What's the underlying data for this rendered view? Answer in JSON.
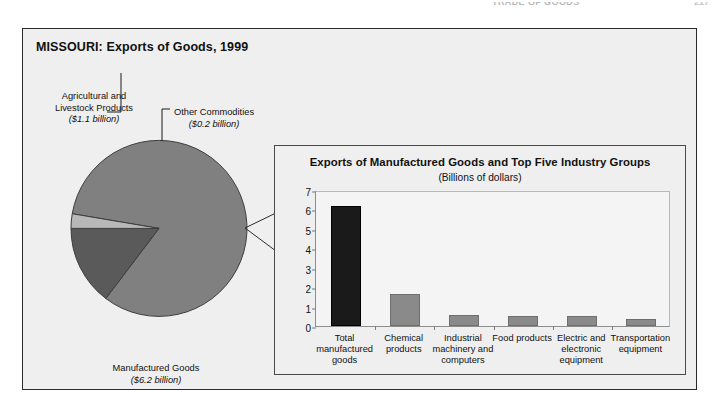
{
  "running_head": {
    "text": "TRADE OF GOODS",
    "page": "217"
  },
  "figure": {
    "title": "MISSOURI: Exports of Goods, 1999",
    "colors": {
      "frame_bg": "#efefef",
      "frame_border": "#2b2b2b",
      "pie_manufactured": "#808080",
      "pie_agricultural": "#5a5a5a",
      "pie_other": "#b8b8b8",
      "bar_total": "#1a1a1a",
      "bar_industry": "#8a8a8a"
    }
  },
  "pie_labels": {
    "agricultural_name": "Agricultural and Livestock Products",
    "agricultural_amount": "($1.1 billion)",
    "other_name": "Other Commodities",
    "other_amount": "($0.2 billion)",
    "manufactured_name": "Manufactured Goods",
    "manufactured_amount": "($6.2 billion)"
  },
  "bar_panel": {
    "title": "Exports of Manufactured Goods and Top Five Industry Groups",
    "subtitle": "(Billions of dollars)"
  },
  "chart_data": [
    {
      "type": "pie",
      "title": "MISSOURI: Exports of Goods, 1999",
      "labels": [
        "Manufactured Goods",
        "Agricultural and Livestock Products",
        "Other Commodities"
      ],
      "values": [
        6.2,
        1.1,
        0.2
      ],
      "value_labels": [
        "($6.2 billion)",
        "($1.1 billion)",
        "($0.2 billion)"
      ],
      "units": "Billions of dollars",
      "total": 7.5,
      "colors": [
        "#808080",
        "#5a5a5a",
        "#b8b8b8"
      ],
      "legend": "none",
      "start_angle_deg": -90,
      "direction": "clockwise"
    },
    {
      "type": "bar",
      "title": "Exports of Manufactured Goods and Top Five Industry Groups",
      "subtitle": "(Billions of dollars)",
      "categories": [
        "Total manufactured goods",
        "Chemical products",
        "Industrial machinery and computers",
        "Food products",
        "Electric and electronic equipment",
        "Transportation equipment"
      ],
      "values": [
        6.2,
        1.65,
        0.55,
        0.5,
        0.5,
        0.35
      ],
      "bar_colors": [
        "#1a1a1a",
        "#8a8a8a",
        "#8a8a8a",
        "#8a8a8a",
        "#8a8a8a",
        "#8a8a8a"
      ],
      "xlabel": "",
      "ylabel": "",
      "ylim": [
        0,
        7
      ],
      "yticks": [
        0,
        1,
        2,
        3,
        4,
        5,
        6,
        7
      ],
      "ytick_labels": [
        "0",
        "1",
        "2",
        "3",
        "4",
        "5",
        "6",
        "7"
      ],
      "grid": false,
      "legend": "none"
    }
  ]
}
